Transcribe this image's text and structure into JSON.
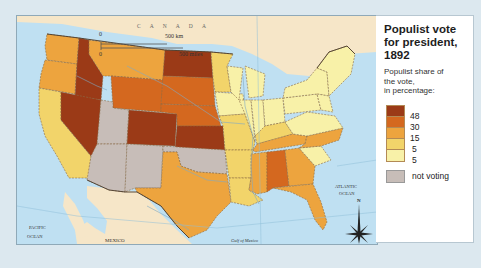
{
  "legend": {
    "title_line1": "Populist vote",
    "title_line2": "for president, 1892",
    "subtitle_line1": "Populist share of",
    "subtitle_line2": "the vote,",
    "subtitle_line3": "in percentage:",
    "scale": [
      {
        "label": "48",
        "color": "#9b3a17"
      },
      {
        "label": "30",
        "color": "#d4681f"
      },
      {
        "label": "15",
        "color": "#eda43e"
      },
      {
        "label": "5",
        "color": "#f2d46a"
      },
      {
        "label": "5",
        "color": "#f8f1a8"
      }
    ],
    "not_voting": {
      "label": "not voting",
      "color": "#c7bdb8"
    }
  },
  "map": {
    "labels": {
      "canada": "C A N A D A",
      "mexico": "MEXICO",
      "pacific_1": "PACIFIC",
      "pacific_2": "OCEAN",
      "atlantic_1": "ATLANTIC",
      "atlantic_2": "OCEAN",
      "gulf": "Gulf of Mexico",
      "compass_n": "N"
    },
    "scale_bar": {
      "zero_km": "0",
      "km_label": "500 km",
      "zero_mi": "0",
      "mi_label": "500 miles"
    },
    "colors": {
      "water": "#bfe0f2",
      "foreign_land": "#f6e6c8",
      "state_border": "#8a6a45",
      "river": "#7fa9c4"
    }
  }
}
